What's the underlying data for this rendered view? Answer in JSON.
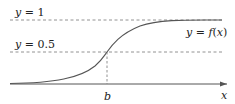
{
  "diagram": {
    "type": "sigmoid-curve",
    "labels": {
      "y1": "y = 1",
      "y05": "y = 0.5",
      "curve": "y = f(x)",
      "b": "b",
      "x_axis": "x"
    },
    "colors": {
      "curve": "#555555",
      "axis": "#555555",
      "dashed": "#777777",
      "text": "#222222"
    }
  }
}
